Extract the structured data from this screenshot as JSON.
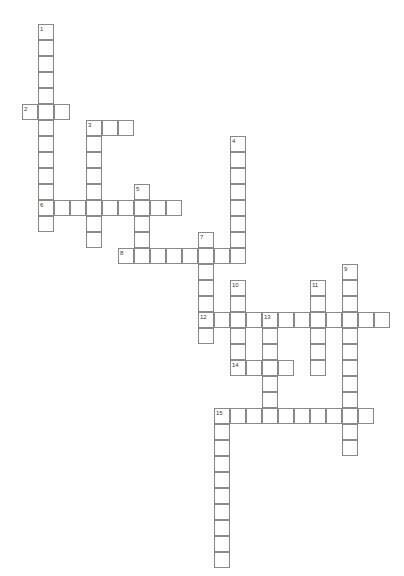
{
  "puzzle": {
    "title": "Crossword Puzzle",
    "cell_size": 16,
    "origin_x": 22,
    "origin_y": 24,
    "grid_columns": 24,
    "grid_rows": 34,
    "colors": {
      "background": "#ffffff",
      "cell_fill": "#ffffff",
      "cell_border": "#8a8a8a",
      "number_text": "#3a3a3a"
    },
    "entries": [
      {
        "number": "1",
        "direction": "down",
        "col": 1,
        "row": 0,
        "length": 13
      },
      {
        "number": "2",
        "direction": "across",
        "col": 0,
        "row": 5,
        "length": 3
      },
      {
        "number": "3",
        "direction": "across",
        "col": 4,
        "row": 6,
        "length": 3
      },
      {
        "number": "3",
        "direction": "down",
        "col": 4,
        "row": 6,
        "length": 9
      },
      {
        "number": "4",
        "direction": "down",
        "col": 13,
        "row": 7,
        "length": 8
      },
      {
        "number": "5",
        "direction": "down",
        "col": 7,
        "row": 10,
        "length": 6
      },
      {
        "number": "6",
        "direction": "across",
        "col": 1,
        "row": 11,
        "length": 9
      },
      {
        "number": "7",
        "direction": "down",
        "col": 11,
        "row": 13,
        "length": 9
      },
      {
        "number": "8",
        "direction": "across",
        "col": 6,
        "row": 14,
        "length": 8
      },
      {
        "number": "9",
        "direction": "down",
        "col": 20,
        "row": 15,
        "length": 11
      },
      {
        "number": "10",
        "direction": "down",
        "col": 13,
        "row": 16,
        "length": 6
      },
      {
        "number": "11",
        "direction": "down",
        "col": 18,
        "row": 16,
        "length": 6
      },
      {
        "number": "12",
        "direction": "across",
        "col": 11,
        "row": 18,
        "length": 12
      },
      {
        "number": "13",
        "direction": "down",
        "col": 15,
        "row": 18,
        "length": 6
      },
      {
        "number": "14",
        "direction": "across",
        "col": 13,
        "row": 21,
        "length": 4
      },
      {
        "number": "15",
        "direction": "across",
        "col": 12,
        "row": 24,
        "length": 10
      },
      {
        "number": "15",
        "direction": "down",
        "col": 12,
        "row": 24,
        "length": 10
      }
    ],
    "cells": [
      {
        "col": 1,
        "row": 0,
        "num": "1"
      },
      {
        "col": 1,
        "row": 1
      },
      {
        "col": 1,
        "row": 2
      },
      {
        "col": 1,
        "row": 3
      },
      {
        "col": 1,
        "row": 4
      },
      {
        "col": 0,
        "row": 5,
        "num": "2"
      },
      {
        "col": 1,
        "row": 5
      },
      {
        "col": 2,
        "row": 5
      },
      {
        "col": 1,
        "row": 6
      },
      {
        "col": 4,
        "row": 6,
        "num": "3"
      },
      {
        "col": 5,
        "row": 6
      },
      {
        "col": 6,
        "row": 6
      },
      {
        "col": 1,
        "row": 7
      },
      {
        "col": 4,
        "row": 7
      },
      {
        "col": 1,
        "row": 8
      },
      {
        "col": 4,
        "row": 8
      },
      {
        "col": 13,
        "row": 7,
        "num": "4"
      },
      {
        "col": 13,
        "row": 8
      },
      {
        "col": 1,
        "row": 9
      },
      {
        "col": 4,
        "row": 9
      },
      {
        "col": 13,
        "row": 9
      },
      {
        "col": 1,
        "row": 10
      },
      {
        "col": 4,
        "row": 10
      },
      {
        "col": 7,
        "row": 10,
        "num": "5"
      },
      {
        "col": 13,
        "row": 10
      },
      {
        "col": 1,
        "row": 11,
        "num": "6"
      },
      {
        "col": 2,
        "row": 11
      },
      {
        "col": 3,
        "row": 11
      },
      {
        "col": 4,
        "row": 11
      },
      {
        "col": 5,
        "row": 11
      },
      {
        "col": 6,
        "row": 11
      },
      {
        "col": 7,
        "row": 11
      },
      {
        "col": 8,
        "row": 11
      },
      {
        "col": 9,
        "row": 11
      },
      {
        "col": 13,
        "row": 11
      },
      {
        "col": 1,
        "row": 12
      },
      {
        "col": 4,
        "row": 12
      },
      {
        "col": 7,
        "row": 12
      },
      {
        "col": 13,
        "row": 12
      },
      {
        "col": 4,
        "row": 13
      },
      {
        "col": 7,
        "row": 13
      },
      {
        "col": 11,
        "row": 13,
        "num": "7"
      },
      {
        "col": 13,
        "row": 13
      },
      {
        "col": 6,
        "row": 14,
        "num": "8"
      },
      {
        "col": 7,
        "row": 14
      },
      {
        "col": 8,
        "row": 14
      },
      {
        "col": 9,
        "row": 14
      },
      {
        "col": 10,
        "row": 14
      },
      {
        "col": 11,
        "row": 14
      },
      {
        "col": 12,
        "row": 14
      },
      {
        "col": 13,
        "row": 14
      },
      {
        "col": 11,
        "row": 15
      },
      {
        "col": 20,
        "row": 15,
        "num": "9"
      },
      {
        "col": 11,
        "row": 16
      },
      {
        "col": 13,
        "row": 16,
        "num": "10"
      },
      {
        "col": 18,
        "row": 16,
        "num": "11"
      },
      {
        "col": 20,
        "row": 16
      },
      {
        "col": 11,
        "row": 17
      },
      {
        "col": 13,
        "row": 17
      },
      {
        "col": 18,
        "row": 17
      },
      {
        "col": 20,
        "row": 17
      },
      {
        "col": 11,
        "row": 18,
        "num": "12"
      },
      {
        "col": 12,
        "row": 18
      },
      {
        "col": 13,
        "row": 18
      },
      {
        "col": 14,
        "row": 18
      },
      {
        "col": 15,
        "row": 18,
        "num": "13"
      },
      {
        "col": 16,
        "row": 18
      },
      {
        "col": 17,
        "row": 18
      },
      {
        "col": 18,
        "row": 18
      },
      {
        "col": 19,
        "row": 18
      },
      {
        "col": 20,
        "row": 18
      },
      {
        "col": 21,
        "row": 18
      },
      {
        "col": 22,
        "row": 18
      },
      {
        "col": 11,
        "row": 19
      },
      {
        "col": 13,
        "row": 19
      },
      {
        "col": 15,
        "row": 19
      },
      {
        "col": 18,
        "row": 19
      },
      {
        "col": 20,
        "row": 19
      },
      {
        "col": 13,
        "row": 20
      },
      {
        "col": 15,
        "row": 20
      },
      {
        "col": 18,
        "row": 20
      },
      {
        "col": 20,
        "row": 20
      },
      {
        "col": 13,
        "row": 21,
        "num": "14"
      },
      {
        "col": 14,
        "row": 21
      },
      {
        "col": 15,
        "row": 21
      },
      {
        "col": 16,
        "row": 21
      },
      {
        "col": 18,
        "row": 21
      },
      {
        "col": 20,
        "row": 21
      },
      {
        "col": 15,
        "row": 22
      },
      {
        "col": 20,
        "row": 22
      },
      {
        "col": 15,
        "row": 23
      },
      {
        "col": 20,
        "row": 23
      },
      {
        "col": 12,
        "row": 24,
        "num": "15"
      },
      {
        "col": 13,
        "row": 24
      },
      {
        "col": 14,
        "row": 24
      },
      {
        "col": 15,
        "row": 24
      },
      {
        "col": 16,
        "row": 24
      },
      {
        "col": 17,
        "row": 24
      },
      {
        "col": 18,
        "row": 24
      },
      {
        "col": 19,
        "row": 24
      },
      {
        "col": 20,
        "row": 24
      },
      {
        "col": 21,
        "row": 24
      },
      {
        "col": 12,
        "row": 25
      },
      {
        "col": 20,
        "row": 25
      },
      {
        "col": 12,
        "row": 26
      },
      {
        "col": 20,
        "row": 26
      },
      {
        "col": 12,
        "row": 27
      },
      {
        "col": 12,
        "row": 28
      },
      {
        "col": 12,
        "row": 29
      },
      {
        "col": 12,
        "row": 30
      },
      {
        "col": 12,
        "row": 31
      },
      {
        "col": 12,
        "row": 32
      },
      {
        "col": 12,
        "row": 33
      }
    ]
  }
}
